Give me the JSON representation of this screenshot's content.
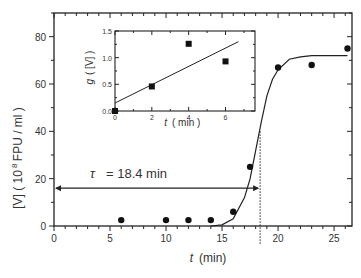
{
  "chart_data": [
    {
      "type": "scatter",
      "title": "",
      "xlabel": "t (min)",
      "ylabel": "[V] (10^8 FPU / ml)",
      "ylabel_parts": {
        "var": "[V]",
        "open": "(",
        "power": "10",
        "exp": "8",
        "unit": "FPU / ml",
        "close": ")"
      },
      "xlim": [
        0,
        26.6
      ],
      "ylim": [
        0,
        90
      ],
      "xticks": [
        0,
        5,
        10,
        15,
        20,
        25
      ],
      "yticks": [
        0,
        20,
        40,
        60,
        80
      ],
      "grid": false,
      "series": [
        {
          "name": "measured",
          "marker": "circle",
          "x": [
            6,
            10,
            12,
            14,
            16,
            17.5,
            20,
            23,
            26.2
          ],
          "y": [
            2.5,
            2.5,
            2.5,
            2.5,
            6,
            25,
            67,
            68,
            75
          ]
        },
        {
          "name": "fit",
          "marker": "line",
          "style": "sigmoid",
          "x": [
            14,
            15,
            16,
            17,
            17.5,
            18,
            18.5,
            19,
            19.5,
            20,
            21,
            22,
            23,
            26.2
          ],
          "y": [
            0,
            0.5,
            3,
            12,
            20,
            32,
            44,
            55,
            62,
            66,
            70.5,
            71.5,
            72,
            72
          ]
        }
      ],
      "annotations": [
        {
          "type": "arrow",
          "label": "τ = 18.4 min",
          "from_x": 0,
          "to_x": 18.4,
          "y": 16
        },
        {
          "type": "vline",
          "style": "dotted",
          "x": 18.4,
          "y_range": [
            -5,
            40
          ]
        }
      ]
    },
    {
      "type": "scatter",
      "title": "inset",
      "xlabel": "t (min)",
      "ylabel": "g([V])",
      "xlim": [
        0,
        7.6
      ],
      "ylim": [
        0,
        1.5
      ],
      "xticks": [
        0,
        2,
        4,
        6
      ],
      "yticks": [
        0.0,
        0.5,
        1.0,
        1.5
      ],
      "ytick_labels": [
        "0.0",
        "0.5",
        "1.0",
        "1.5"
      ],
      "series": [
        {
          "name": "g values",
          "marker": "square",
          "x": [
            0,
            2,
            4,
            6
          ],
          "y": [
            0.0,
            0.46,
            1.26,
            0.93
          ]
        },
        {
          "name": "linear fit",
          "marker": "line",
          "x": [
            0,
            6.7
          ],
          "y": [
            0.15,
            1.3
          ]
        }
      ]
    }
  ],
  "labels": {
    "x_axis": "t",
    "x_unit": "(min)",
    "tau": "τ",
    "tau_value": "= 18.4 min",
    "inset_x": "t",
    "inset_x_unit": "( min )",
    "inset_y": "g",
    "inset_y_arg": "( [V] )"
  }
}
